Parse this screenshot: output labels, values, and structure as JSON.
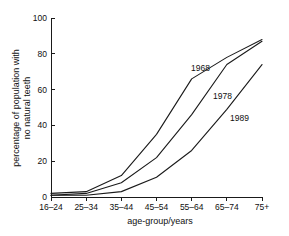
{
  "chart_data": {
    "type": "line",
    "title": "",
    "xlabel": "age-group/years",
    "ylabel": "percentage of population with no natural teeth",
    "categories": [
      "16–24",
      "25–34",
      "35–44",
      "45–54",
      "55–64",
      "65–74",
      "75+"
    ],
    "ylim": [
      0,
      100
    ],
    "yticks": [
      0,
      20,
      40,
      60,
      80,
      100
    ],
    "ytick_labels": [
      "0",
      "20",
      "40",
      "60",
      "80",
      "100"
    ],
    "grid": false,
    "legend_position": "inline-labels",
    "line_color": "#1a1a1a",
    "series": [
      {
        "name": "1968",
        "values": [
          2,
          3,
          12,
          35,
          66,
          78,
          88
        ],
        "label_text": "1968"
      },
      {
        "name": "1978",
        "values": [
          1,
          2,
          8,
          22,
          46,
          74,
          87
        ],
        "label_text": "1978"
      },
      {
        "name": "1989",
        "values": [
          1,
          1,
          3,
          11,
          26,
          49,
          74
        ],
        "label_text": "1989"
      }
    ],
    "annotations": [
      {
        "text": "1968",
        "series": "1968"
      },
      {
        "text": "1978",
        "series": "1978"
      },
      {
        "text": "1989",
        "series": "1989"
      }
    ]
  }
}
